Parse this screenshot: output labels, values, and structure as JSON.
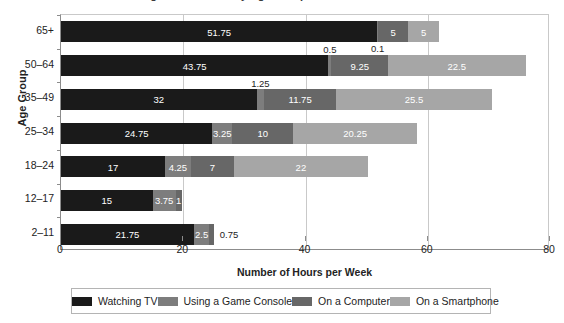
{
  "title": "Average Screen Time by Age Group",
  "chart_data": {
    "type": "bar",
    "orientation": "horizontal",
    "stacked": true,
    "title": "Average Screen Time by Age Group",
    "xlabel": "Number of Hours per Week",
    "ylabel": "Age Group",
    "xlim": [
      0,
      80
    ],
    "xticks": [
      0,
      20,
      40,
      60,
      80
    ],
    "grid": true,
    "legend_position": "bottom",
    "categories": [
      "2–11",
      "12–17",
      "18–24",
      "25–34",
      "35–49",
      "50–64",
      "65+"
    ],
    "series": [
      {
        "name": "Watching TV",
        "color": "#1a1a1a",
        "values": [
          21.75,
          15,
          17,
          24.75,
          32,
          43.75,
          51.75
        ]
      },
      {
        "name": "Using a Game Console",
        "color": "#7d7d7d",
        "values": [
          2.5,
          3.75,
          4.25,
          3.25,
          1.25,
          0.5,
          0.1
        ]
      },
      {
        "name": "On a Computer",
        "color": "#676767",
        "values": [
          0.75,
          1,
          7,
          10,
          11.75,
          9.25,
          5
        ]
      },
      {
        "name": "On a Smartphone",
        "color": "#a6a6a6",
        "values": [
          0,
          0,
          22,
          20.25,
          25.5,
          22.5,
          5
        ]
      }
    ],
    "rows": [
      {
        "category": "65+",
        "segments": [
          {
            "series": "Watching TV",
            "value": 51.75,
            "label": "51.75",
            "label_pos": "inside"
          },
          {
            "series": "Using a Game Console",
            "value": 0.1,
            "label": "0.1",
            "label_pos": "below"
          },
          {
            "series": "On a Computer",
            "value": 5,
            "label": "5",
            "label_pos": "inside"
          },
          {
            "series": "On a Smartphone",
            "value": 5,
            "label": "5",
            "label_pos": "inside"
          }
        ]
      },
      {
        "category": "50–64",
        "segments": [
          {
            "series": "Watching TV",
            "value": 43.75,
            "label": "43.75",
            "label_pos": "inside"
          },
          {
            "series": "Using a Game Console",
            "value": 0.5,
            "label": "0.5",
            "label_pos": "above"
          },
          {
            "series": "On a Computer",
            "value": 9.25,
            "label": "9.25",
            "label_pos": "inside"
          },
          {
            "series": "On a Smartphone",
            "value": 22.5,
            "label": "22.5",
            "label_pos": "inside"
          }
        ]
      },
      {
        "category": "35–49",
        "segments": [
          {
            "series": "Watching TV",
            "value": 32,
            "label": "32",
            "label_pos": "inside"
          },
          {
            "series": "Using a Game Console",
            "value": 1.25,
            "label": "1.25",
            "label_pos": "above"
          },
          {
            "series": "On a Computer",
            "value": 11.75,
            "label": "11.75",
            "label_pos": "inside"
          },
          {
            "series": "On a Smartphone",
            "value": 25.5,
            "label": "25.5",
            "label_pos": "inside"
          }
        ]
      },
      {
        "category": "25–34",
        "segments": [
          {
            "series": "Watching TV",
            "value": 24.75,
            "label": "24.75",
            "label_pos": "inside"
          },
          {
            "series": "Using a Game Console",
            "value": 3.25,
            "label": "3.25",
            "label_pos": "inside"
          },
          {
            "series": "On a Computer",
            "value": 10,
            "label": "10",
            "label_pos": "inside"
          },
          {
            "series": "On a Smartphone",
            "value": 20.25,
            "label": "20.25",
            "label_pos": "inside"
          }
        ]
      },
      {
        "category": "18–24",
        "segments": [
          {
            "series": "Watching TV",
            "value": 17,
            "label": "17",
            "label_pos": "inside"
          },
          {
            "series": "Using a Game Console",
            "value": 4.25,
            "label": "4.25",
            "label_pos": "inside"
          },
          {
            "series": "On a Computer",
            "value": 7,
            "label": "7",
            "label_pos": "inside"
          },
          {
            "series": "On a Smartphone",
            "value": 22,
            "label": "22",
            "label_pos": "inside"
          }
        ]
      },
      {
        "category": "12–17",
        "segments": [
          {
            "series": "Watching TV",
            "value": 15,
            "label": "15",
            "label_pos": "inside"
          },
          {
            "series": "Using a Game Console",
            "value": 3.75,
            "label": "3.75",
            "label_pos": "inside"
          },
          {
            "series": "On a Computer",
            "value": 1,
            "label": "1",
            "label_pos": "inside"
          }
        ]
      },
      {
        "category": "2–11",
        "segments": [
          {
            "series": "Watching TV",
            "value": 21.75,
            "label": "21.75",
            "label_pos": "inside"
          },
          {
            "series": "Using a Game Console",
            "value": 2.5,
            "label": "2.5",
            "label_pos": "inside"
          },
          {
            "series": "On a Computer",
            "value": 0.75,
            "label": "0.75",
            "label_pos": "right"
          }
        ]
      }
    ]
  },
  "legend": {
    "items": [
      {
        "label": "Watching TV",
        "color": "#1a1a1a"
      },
      {
        "label": "Using a Game Console",
        "color": "#7d7d7d"
      },
      {
        "label": "On a Computer",
        "color": "#676767"
      },
      {
        "label": "On a Smartphone",
        "color": "#a6a6a6"
      }
    ]
  }
}
